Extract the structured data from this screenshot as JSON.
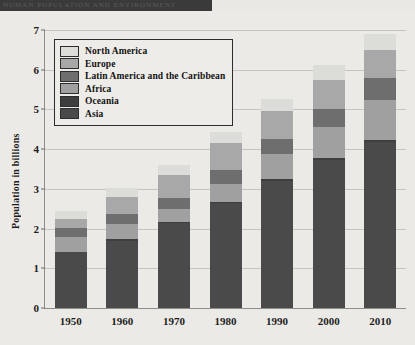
{
  "banner": {
    "text": "HUMAN POPULATION AND ENVIRONMENT"
  },
  "chart_data": {
    "type": "bar",
    "subtype": "stacked-vertical",
    "title": "",
    "xlabel": "",
    "ylabel": "Population in billions",
    "ylim": [
      0,
      7
    ],
    "ytick_values": [
      0,
      1,
      2,
      3,
      4,
      5,
      6,
      7
    ],
    "ytick_labels": [
      "0",
      "1",
      "2",
      "3",
      "4",
      "5",
      "6",
      "7"
    ],
    "grid": true,
    "legend_position": "upper-left",
    "categories": [
      "1950",
      "1960",
      "1970",
      "1980",
      "1990",
      "2000",
      "2010"
    ],
    "stack_order_bottom_to_top": [
      "Asia",
      "Oceania",
      "Africa",
      "Latin America and the Caribbean",
      "Europe",
      "North America"
    ],
    "series": [
      {
        "name": "Asia",
        "color": "#4a4a4a",
        "values": [
          1.4,
          1.7,
          2.14,
          2.64,
          3.2,
          3.72,
          4.17
        ]
      },
      {
        "name": "Oceania",
        "color": "#3e3e3e",
        "values": [
          0.02,
          0.03,
          0.03,
          0.04,
          0.04,
          0.05,
          0.06
        ]
      },
      {
        "name": "Africa",
        "color": "#a0a0a0",
        "values": [
          0.36,
          0.39,
          0.33,
          0.45,
          0.63,
          0.79,
          1.02
        ]
      },
      {
        "name": "Latin America and the Caribbean",
        "color": "#6e6e6e",
        "values": [
          0.24,
          0.26,
          0.28,
          0.34,
          0.38,
          0.45,
          0.53
        ]
      },
      {
        "name": "Europe",
        "color": "#a8a8a8",
        "values": [
          0.23,
          0.42,
          0.57,
          0.69,
          0.72,
          0.73,
          0.73
        ]
      },
      {
        "name": "North America",
        "color": "#dcdcd8",
        "values": [
          0.2,
          0.22,
          0.24,
          0.27,
          0.3,
          0.37,
          0.38
        ]
      }
    ],
    "totals": [
      2.45,
      3.02,
      3.69,
      4.43,
      5.27,
      6.11,
      6.89
    ],
    "legend_entries": [
      "North America",
      "Europe",
      "Latin America and the Caribbean",
      "Africa",
      "Oceania",
      "Asia"
    ],
    "legend_colors": [
      "#dcdcd8",
      "#a8a8a8",
      "#6e6e6e",
      "#a0a0a0",
      "#3e3e3e",
      "#4a4a4a"
    ]
  }
}
